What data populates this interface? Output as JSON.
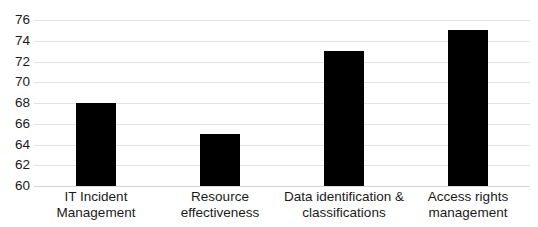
{
  "chart_data": {
    "type": "bar",
    "title": "",
    "subtitle": "",
    "xlabel": "",
    "ylabel": "",
    "categories": [
      "IT Incident Management",
      "Resource effectiveness",
      "Data identification & classifications",
      "Access rights management"
    ],
    "category_lines": [
      [
        "IT Incident",
        "Management"
      ],
      [
        "Resource",
        "effectiveness"
      ],
      [
        "Data identification &",
        "classifications"
      ],
      [
        "Access rights",
        "management"
      ]
    ],
    "values": [
      68,
      65,
      73,
      75
    ],
    "ylim": [
      60,
      76
    ],
    "ytick_step": 2,
    "yticks": [
      60,
      62,
      64,
      66,
      68,
      70,
      72,
      74,
      76
    ],
    "ytick_labels": [
      "60",
      "62",
      "64",
      "66",
      "68",
      "70",
      "72",
      "74",
      "76"
    ],
    "grid": true,
    "grid_axis": "y",
    "legend": false,
    "legend_position": "none",
    "bar_color": "#000000",
    "grid_color": "#e2e2e2",
    "text_color": "#1a1a1a",
    "background_color": "#ffffff"
  }
}
